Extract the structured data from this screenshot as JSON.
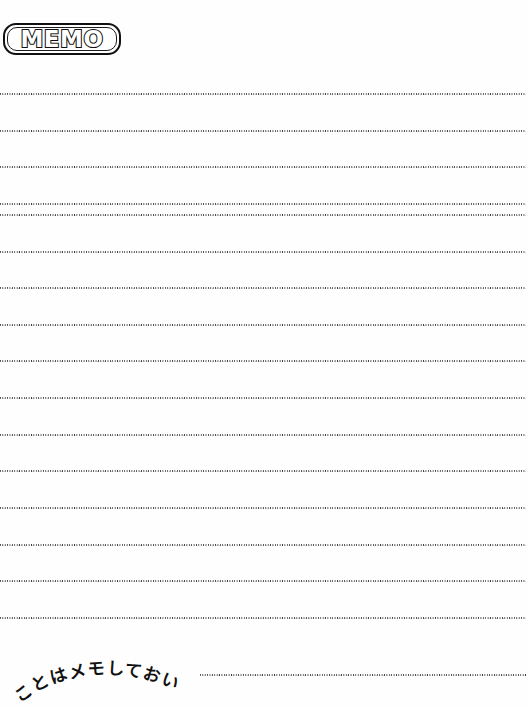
{
  "page": {
    "width": 528,
    "height": 707,
    "background_color": "#fefefe",
    "ink_color": "#111111",
    "rule_color": "#3a3a3a"
  },
  "header": {
    "badge_label": "MEMO",
    "badge_shape": "rounded-rectangle-outline",
    "badge_style": "hollow-outlined-letters"
  },
  "footer": {
    "arc_caption": "ことはメモしておい",
    "arc_caption_romaji_note": "koto wa memo shite oi",
    "arc_direction": "upward-arc"
  },
  "ruled_lines": {
    "style": "fine-dotted",
    "count": 17,
    "full_width_left": 0,
    "full_width_right": 526,
    "lines": [
      {
        "y": 93,
        "x_start": 0,
        "x_end": 526,
        "partial": false
      },
      {
        "y": 130,
        "x_start": 0,
        "x_end": 526,
        "partial": false
      },
      {
        "y": 166,
        "x_start": 0,
        "x_end": 526,
        "partial": false
      },
      {
        "y": 203,
        "x_start": 0,
        "x_end": 526,
        "partial": false
      },
      {
        "y": 214,
        "x_start": 0,
        "x_end": 526,
        "partial": false
      },
      {
        "y": 251,
        "x_start": 0,
        "x_end": 526,
        "partial": false
      },
      {
        "y": 287,
        "x_start": 0,
        "x_end": 526,
        "partial": false
      },
      {
        "y": 324,
        "x_start": 0,
        "x_end": 526,
        "partial": false
      },
      {
        "y": 360,
        "x_start": 0,
        "x_end": 526,
        "partial": false
      },
      {
        "y": 397,
        "x_start": 0,
        "x_end": 526,
        "partial": false
      },
      {
        "y": 434,
        "x_start": 0,
        "x_end": 526,
        "partial": false
      },
      {
        "y": 470,
        "x_start": 0,
        "x_end": 526,
        "partial": false
      },
      {
        "y": 507,
        "x_start": 0,
        "x_end": 526,
        "partial": false
      },
      {
        "y": 544,
        "x_start": 0,
        "x_end": 526,
        "partial": false
      },
      {
        "y": 580,
        "x_start": 0,
        "x_end": 526,
        "partial": false
      },
      {
        "y": 617,
        "x_start": 0,
        "x_end": 526,
        "partial": false
      },
      {
        "y": 674,
        "x_start": 200,
        "x_end": 526,
        "partial": true
      }
    ]
  }
}
